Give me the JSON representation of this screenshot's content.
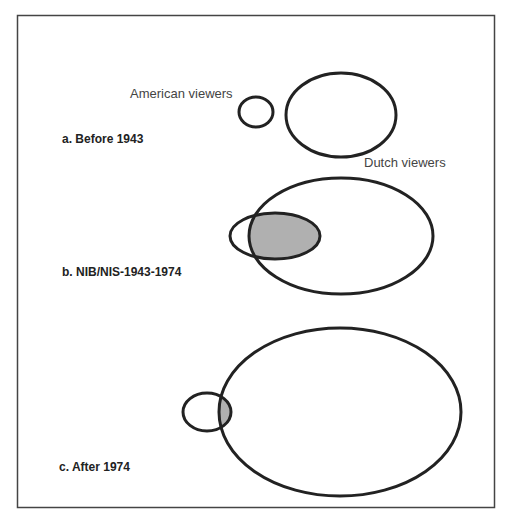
{
  "figure": {
    "panels": [
      {
        "id": "a",
        "label": "a. Before 1943"
      },
      {
        "id": "b",
        "label": "b. NIB/NIS-1943-1974"
      },
      {
        "id": "c",
        "label": "c. After 1974"
      }
    ],
    "annotations": {
      "american": "American viewers",
      "dutch": "Dutch viewers"
    },
    "colors": {
      "stroke": "#222222",
      "overlap_fill": "#b0b0b0",
      "frame": "#444444"
    }
  }
}
